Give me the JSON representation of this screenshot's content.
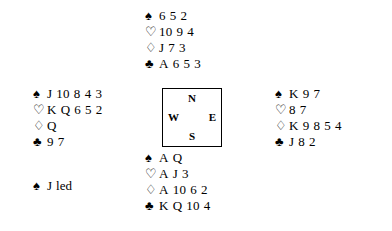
{
  "diagram": {
    "type": "bridge-deal",
    "background_color": "#ffffff",
    "text_color": "#000000"
  },
  "suit_symbols": {
    "spade": "♠",
    "heart": "♡",
    "diamond": "♢",
    "club": "♣"
  },
  "compass": {
    "north": "N",
    "west": "W",
    "east": "E",
    "south": "S"
  },
  "hands": {
    "north": {
      "position_label": "North",
      "suits": [
        {
          "symbol": "♠",
          "icon": "spade-icon",
          "fill": "solid",
          "cards": [
            "6",
            "5",
            "2"
          ]
        },
        {
          "symbol": "♡",
          "icon": "heart-icon",
          "fill": "hollow",
          "cards": [
            "10",
            "9",
            "4"
          ]
        },
        {
          "symbol": "♢",
          "icon": "diamond-icon",
          "fill": "hollow",
          "cards": [
            "J",
            "7",
            "3"
          ]
        },
        {
          "symbol": "♣",
          "icon": "club-icon",
          "fill": "solid",
          "cards": [
            "A",
            "6",
            "5",
            "3"
          ]
        }
      ]
    },
    "west": {
      "position_label": "West",
      "suits": [
        {
          "symbol": "♠",
          "icon": "spade-icon",
          "fill": "solid",
          "cards": [
            "J",
            "10",
            "8",
            "4",
            "3"
          ]
        },
        {
          "symbol": "♡",
          "icon": "heart-icon",
          "fill": "hollow",
          "cards": [
            "K",
            "Q",
            "6",
            "5",
            "2"
          ]
        },
        {
          "symbol": "♢",
          "icon": "diamond-icon",
          "fill": "hollow",
          "cards": [
            "Q"
          ]
        },
        {
          "symbol": "♣",
          "icon": "club-icon",
          "fill": "solid",
          "cards": [
            "9",
            "7"
          ]
        }
      ]
    },
    "east": {
      "position_label": "East",
      "suits": [
        {
          "symbol": "♠",
          "icon": "spade-icon",
          "fill": "solid",
          "cards": [
            "K",
            "9",
            "7"
          ]
        },
        {
          "symbol": "♡",
          "icon": "heart-icon",
          "fill": "hollow",
          "cards": [
            "8",
            "7"
          ]
        },
        {
          "symbol": "♢",
          "icon": "diamond-icon",
          "fill": "hollow",
          "cards": [
            "K",
            "9",
            "8",
            "5",
            "4"
          ]
        },
        {
          "symbol": "♣",
          "icon": "club-icon",
          "fill": "solid",
          "cards": [
            "J",
            "8",
            "2"
          ]
        }
      ]
    },
    "south": {
      "position_label": "South",
      "suits": [
        {
          "symbol": "♠",
          "icon": "spade-icon",
          "fill": "solid",
          "cards": [
            "A",
            "Q"
          ]
        },
        {
          "symbol": "♡",
          "icon": "heart-icon",
          "fill": "hollow",
          "cards": [
            "A",
            "J",
            "3"
          ]
        },
        {
          "symbol": "♢",
          "icon": "diamond-icon",
          "fill": "hollow",
          "cards": [
            "A",
            "10",
            "6",
            "2"
          ]
        },
        {
          "symbol": "♣",
          "icon": "club-icon",
          "fill": "solid",
          "cards": [
            "K",
            "Q",
            "10",
            "4"
          ]
        }
      ]
    }
  },
  "lead": {
    "symbol": "♠",
    "icon": "spade-icon",
    "rank": "J",
    "text": "led"
  }
}
